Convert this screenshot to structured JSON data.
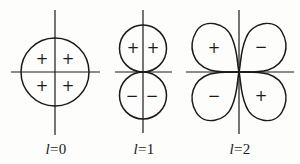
{
  "figure": {
    "panels": [
      {
        "id": "l0",
        "caption_var": "l",
        "caption_eq": "=0",
        "shape": "circle",
        "signs": [
          "+",
          "+",
          "+",
          "+"
        ]
      },
      {
        "id": "l1",
        "caption_var": "l",
        "caption_eq": "=1",
        "shape": "two-lobes-vertical",
        "signs": [
          "+",
          "+",
          "−",
          "−"
        ]
      },
      {
        "id": "l2",
        "caption_var": "l",
        "caption_eq": "=2",
        "shape": "four-lobes-cloverleaf",
        "signs": [
          "+",
          "−",
          "−",
          "+"
        ]
      }
    ],
    "colors": {
      "stroke": "#1a1a1a",
      "background": "#fdfdfc"
    }
  }
}
